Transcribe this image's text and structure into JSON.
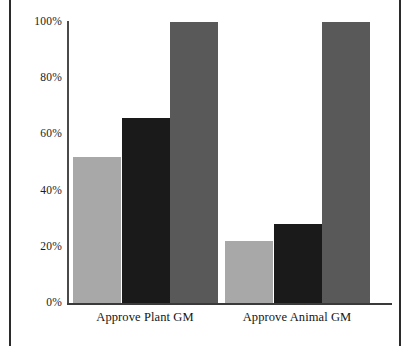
{
  "chart_data": {
    "type": "bar",
    "title": "",
    "subtitle": "",
    "xlabel": "",
    "ylabel": "",
    "categories": [
      "Approve Plant GM",
      "Approve Animal GM"
    ],
    "series": [
      {
        "name": "series-1",
        "color": "#a8a8a8",
        "values": [
          52,
          66
        ]
      },
      {
        "name": "series-2",
        "color": "#1a1a1a",
        "values": [
          66,
          28
        ]
      },
      {
        "name": "series-3",
        "color": "#595959",
        "values": [
          100,
          100
        ]
      }
    ],
    "values_by_category": {
      "Approve Plant GM": [
        52,
        66,
        100
      ],
      "Approve Animal GM": [
        22,
        28,
        100
      ]
    },
    "ylim": [
      0,
      100
    ],
    "y_ticks": [
      0,
      20,
      40,
      60,
      80,
      100
    ],
    "y_tick_labels": [
      "0%",
      "20%",
      "40%",
      "60%",
      "80%",
      "100%"
    ],
    "grid": false,
    "legend": "none",
    "legend_position": "none"
  },
  "axes": {
    "y_tick_labels": [
      "100%",
      "80%",
      "60%",
      "40%",
      "20%",
      "0%"
    ],
    "y_tick_values": [
      100,
      80,
      60,
      40,
      20,
      0
    ]
  },
  "groups": [
    {
      "label": "Approve Plant GM",
      "bars": [
        {
          "name": "bar-plant-1",
          "value": 52,
          "color": "#a8a8a8"
        },
        {
          "name": "bar-plant-2",
          "value": 66,
          "color": "#1a1a1a"
        },
        {
          "name": "bar-plant-3",
          "value": 100,
          "color": "#595959"
        }
      ]
    },
    {
      "label": "Approve Animal GM",
      "bars": [
        {
          "name": "bar-animal-1",
          "value": 22,
          "color": "#a8a8a8"
        },
        {
          "name": "bar-animal-2",
          "value": 28,
          "color": "#1a1a1a"
        },
        {
          "name": "bar-animal-3",
          "value": 100,
          "color": "#595959"
        }
      ]
    }
  ]
}
